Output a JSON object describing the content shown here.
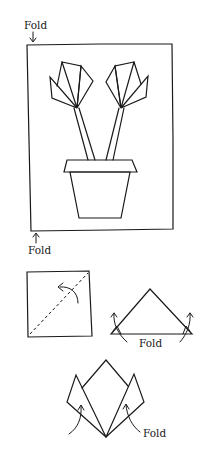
{
  "diagram": {
    "type": "origami-instructions",
    "stroke_color": "#1a1a1a",
    "background_color": "#ffffff",
    "main_frame": {
      "description": "Framed picture of two origami tulips in a flower pot",
      "top_fold_label": "Fold",
      "bottom_fold_label": "Fold"
    },
    "step_1": {
      "description": "Square paper with diagonal dashed fold line and curved arrow"
    },
    "step_2": {
      "description": "Triangle with corners folded upward",
      "fold_label": "Fold"
    },
    "step_3": {
      "description": "Tulip flower shape with side petals folded up",
      "fold_label": "Fold"
    }
  }
}
